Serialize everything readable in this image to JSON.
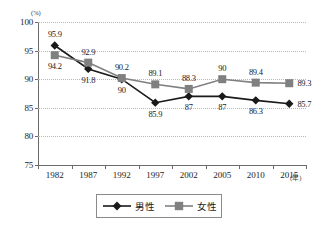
{
  "chart_data": {
    "type": "line",
    "title": "",
    "xlabel": "年",
    "ylabel": "(%)",
    "x_unit": "(年)",
    "y_unit": "(%)",
    "categories": [
      "1982",
      "1987",
      "1992",
      "1997",
      "2002",
      "2005",
      "2010",
      "2015"
    ],
    "ylim": [
      75,
      100
    ],
    "yticks": [
      75,
      80,
      85,
      90,
      95,
      100
    ],
    "ytick_labels": [
      "75",
      "80",
      "85",
      "90",
      "95",
      "100"
    ],
    "grid": true,
    "grid_style": "dotted-horizontal",
    "legend_position": "bottom-center",
    "series": [
      {
        "name": "男性",
        "marker": "diamond",
        "color": "#1a1a1a",
        "values": [
          95.9,
          91.8,
          90,
          85.9,
          87,
          87,
          86.3,
          85.7
        ],
        "labels": [
          "95.9",
          "91.8",
          "90",
          "85.9",
          "87",
          "87",
          "86.3",
          "85.7"
        ],
        "label_positions": [
          "above",
          "below",
          "below",
          "below",
          "below",
          "below",
          "below",
          "right"
        ]
      },
      {
        "name": "女性",
        "marker": "square",
        "color": "#808080",
        "values": [
          94.2,
          92.9,
          90.2,
          89.1,
          88.3,
          90,
          89.4,
          89.3
        ],
        "labels": [
          "94.2",
          "92.9",
          "90.2",
          "89.1",
          "88.3",
          "90",
          "89.4",
          "89.3"
        ],
        "label_positions": [
          "below",
          "above",
          "above",
          "above",
          "above",
          "above",
          "above",
          "right"
        ]
      }
    ]
  },
  "legend": {
    "items": [
      {
        "label": "男性",
        "marker": "diamond-marker",
        "color": "#1a1a1a"
      },
      {
        "label": "女性",
        "marker": "square-marker",
        "color": "#808080"
      }
    ]
  }
}
